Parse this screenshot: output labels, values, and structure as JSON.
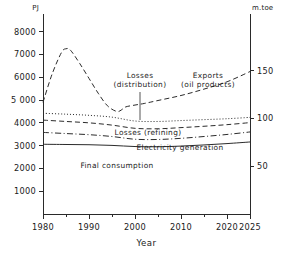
{
  "chart_data": {
    "type": "line",
    "title": "",
    "xlabel": "Year",
    "ylabel": "PJ",
    "y2label": "m.toe",
    "xlim": [
      1980,
      2025
    ],
    "ylim": [
      0,
      8600
    ],
    "y2lim": [
      0,
      205
    ],
    "grid": false,
    "legend": "inline-annotations",
    "x_ticks": [
      1980,
      1990,
      2000,
      2010,
      2020,
      2025
    ],
    "x_tick_labels": [
      "1980",
      "1990",
      "2000",
      "2010",
      "2020",
      "2025"
    ],
    "x_minor_tick_step": 5,
    "y_ticks": [
      1000,
      2000,
      3000,
      4000,
      5000,
      6000,
      7000,
      8000
    ],
    "y_tick_labels": [
      "1000",
      "2000",
      "3000",
      "4000",
      "5 000",
      "6000",
      "7000",
      "8000"
    ],
    "y2_ticks": [
      50,
      100,
      150
    ],
    "y2_tick_labels": [
      "50",
      "100",
      "150"
    ],
    "series": [
      {
        "name": "Exports (oil products)",
        "style": "dashed",
        "x": [
          1980,
          1982,
          1984,
          1985,
          1986,
          1988,
          1990,
          1992,
          1994,
          1996,
          1997,
          1998,
          2000,
          2002,
          2005,
          2010,
          2015,
          2020,
          2025
        ],
        "values": [
          4900,
          6150,
          7080,
          7250,
          7180,
          6600,
          5950,
          5300,
          4750,
          4500,
          4560,
          4700,
          4780,
          4850,
          4980,
          5200,
          5480,
          5800,
          6250
        ]
      },
      {
        "name": "Losses (distribution)",
        "style": "dotted",
        "x": [
          1980,
          1985,
          1990,
          1995,
          2000,
          2005,
          2010,
          2015,
          2020,
          2025
        ],
        "values": [
          4420,
          4380,
          4330,
          4250,
          4080,
          4060,
          4100,
          4140,
          4180,
          4240
        ]
      },
      {
        "name": "Losses (refining)",
        "style": "dashed",
        "x": [
          1980,
          1985,
          1990,
          1995,
          2000,
          2005,
          2010,
          2015,
          2020,
          2025
        ],
        "values": [
          4120,
          4060,
          4000,
          3900,
          3760,
          3740,
          3790,
          3850,
          3920,
          4010
        ]
      },
      {
        "name": "Electricity generation",
        "style": "dashdot",
        "x": [
          1980,
          1985,
          1990,
          1995,
          2000,
          2005,
          2010,
          2015,
          2020,
          2025
        ],
        "values": [
          3580,
          3530,
          3480,
          3400,
          3280,
          3270,
          3320,
          3400,
          3490,
          3600
        ]
      },
      {
        "name": "Final consumption",
        "style": "solid",
        "x": [
          1980,
          1985,
          1990,
          1995,
          2000,
          2005,
          2010,
          2015,
          2020,
          2025
        ],
        "values": [
          3060,
          3050,
          3040,
          3010,
          2960,
          2950,
          2980,
          3030,
          3090,
          3160
        ]
      }
    ],
    "annotations": [
      {
        "name": "losses-distribution",
        "line1": "Losses",
        "line2": "(distribution)",
        "x": 140,
        "y": 78,
        "leader": {
          "x1": 140,
          "y1": 92,
          "x2": 140,
          "y2": 120
        }
      },
      {
        "name": "exports-oil-products",
        "line1": "Exports",
        "line2": "(oil products)",
        "x": 208,
        "y": 78,
        "leader": null
      },
      {
        "name": "losses-refining",
        "line1": "Losses (refining)",
        "line2": "",
        "x": 148,
        "y": 135,
        "leader": null
      },
      {
        "name": "electricity-generation",
        "line1": "Electricity  generation",
        "line2": "",
        "x": 180,
        "y": 150,
        "leader": null
      },
      {
        "name": "final-consumption",
        "line1": "Final consumption",
        "line2": "",
        "x": 117,
        "y": 168,
        "leader": null
      }
    ]
  }
}
